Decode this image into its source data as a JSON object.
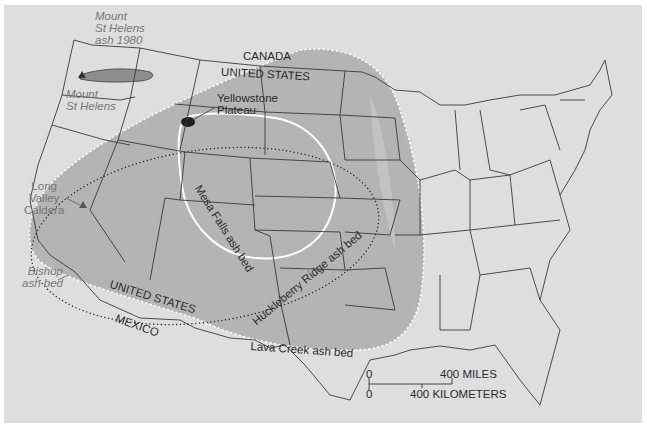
{
  "map": {
    "title": "Volcanic ash beds across the United States",
    "colors": {
      "background": "#dedede",
      "lava_creek_fill": "#b4b4b4",
      "mt_st_helens_fill": "#8e8e8e",
      "caldera_fill": "#1f1f1f",
      "border_line": "#3a3a3a",
      "ash_outline_white": "#ffffff",
      "label_dark": "#2b2b2b",
      "label_gray": "#777777"
    },
    "labels": {
      "mt_st_helens_ash_1980": [
        "Mount",
        "St Helens",
        "ash 1980"
      ],
      "mt_st_helens": [
        "Mount",
        "St Helens"
      ],
      "canada": "CANADA",
      "united_states_north": "UNITED STATES",
      "yellowstone_plateau": [
        "Yellowstone",
        "Plateau"
      ],
      "long_valley_caldera": [
        "Long",
        "Valley",
        "Caldera"
      ],
      "bishop_ash_bed": [
        "Bishop",
        "ash bed"
      ],
      "mesa_falls_ash_bed": "Mesa Falls ash bed",
      "huckleberry_ridge_ash_bed": "Huckleberry Ridge ash bed",
      "united_states_south": "UNITED STATES",
      "mexico": "MEXICO",
      "lava_creek_ash_bed": "Lava Creek ash bed"
    },
    "scale_bar": {
      "miles_zero": "0",
      "miles_label": "400 MILES",
      "km_zero": "0",
      "km_label": "400 KILOMETERS"
    },
    "ash_beds": [
      {
        "name": "Lava Creek ash bed",
        "style": "gray fill, white dotted outline"
      },
      {
        "name": "Huckleberry Ridge ash bed",
        "style": "black dotted outline"
      },
      {
        "name": "Mesa Falls ash bed",
        "style": "white solid outline"
      },
      {
        "name": "Bishop ash bed",
        "style": "gray fill (west edge)"
      },
      {
        "name": "Mount St Helens ash 1980",
        "style": "dark gray elongated fill"
      }
    ],
    "source_markers": [
      {
        "name": "Mount St Helens",
        "glyph": "triangle"
      },
      {
        "name": "Long Valley Caldera",
        "glyph": "triangle"
      },
      {
        "name": "Yellowstone Plateau",
        "glyph": "black ellipse"
      }
    ]
  }
}
